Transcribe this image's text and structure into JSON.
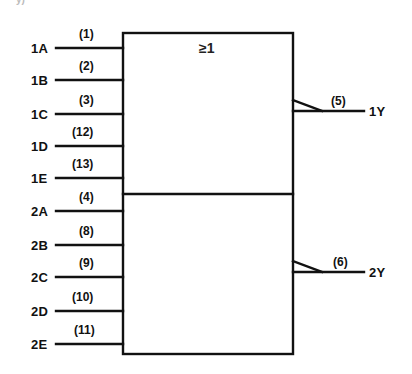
{
  "figure": {
    "type": "logic-symbol",
    "clipped_label_fragment": "y)",
    "gate_qualifier": "≥1",
    "colors": {
      "line": "#111111",
      "background": "#ffffff"
    }
  },
  "gates": [
    {
      "name": "gate-1",
      "inputs": [
        {
          "label": "1A",
          "pin": "(1)"
        },
        {
          "label": "1B",
          "pin": "(2)"
        },
        {
          "label": "1C",
          "pin": "(3)"
        },
        {
          "label": "1D",
          "pin": "(12)"
        },
        {
          "label": "1E",
          "pin": "(13)"
        }
      ],
      "output": {
        "label": "1Y",
        "pin": "(5)",
        "negated": true
      }
    },
    {
      "name": "gate-2",
      "inputs": [
        {
          "label": "2A",
          "pin": "(4)"
        },
        {
          "label": "2B",
          "pin": "(8)"
        },
        {
          "label": "2C",
          "pin": "(9)"
        },
        {
          "label": "2D",
          "pin": "(10)"
        },
        {
          "label": "2E",
          "pin": "(11)"
        }
      ],
      "output": {
        "label": "2Y",
        "pin": "(6)",
        "negated": true
      }
    }
  ]
}
